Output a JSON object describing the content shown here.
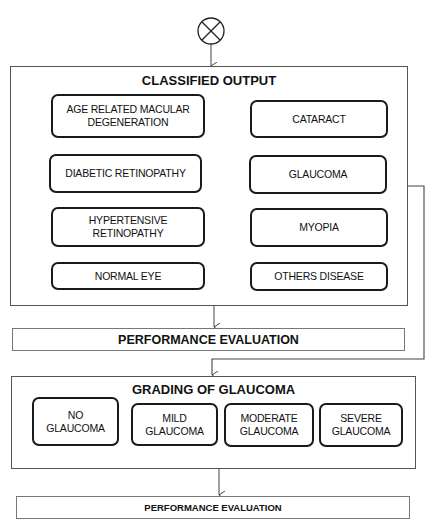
{
  "start_symbol": "summing-junction",
  "classified_output": {
    "title": "CLASSIFIED OUTPUT",
    "classes": [
      {
        "label": "AGE RELATED MACULAR\nDEGENERATION"
      },
      {
        "label": "CATARACT"
      },
      {
        "label": "DIABETIC RETINOPATHY"
      },
      {
        "label": "GLAUCOMA"
      },
      {
        "label": "HYPERTENSIVE\nRETINOPATHY"
      },
      {
        "label": "MYOPIA"
      },
      {
        "label": "NORMAL EYE"
      },
      {
        "label": "OTHERS DISEASE"
      }
    ]
  },
  "evaluation_1": {
    "label": "PERFORMANCE EVALUATION"
  },
  "grading": {
    "title": "GRADING OF GLAUCOMA",
    "grades": [
      {
        "label": "NO\nGLAUCOMA"
      },
      {
        "label": "MILD\nGLAUCOMA"
      },
      {
        "label": "MODERATE\nGLAUCOMA"
      },
      {
        "label": "SEVERE\nGLAUCOMA"
      }
    ]
  },
  "evaluation_2": {
    "label": "PERFORMANCE EVALUATION"
  },
  "colors": {
    "stroke": "#1a1a1a",
    "frame": "#555555",
    "background": "#ffffff"
  }
}
